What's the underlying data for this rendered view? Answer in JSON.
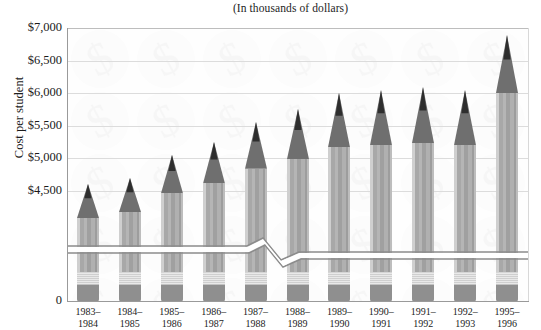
{
  "chart_data": {
    "type": "bar",
    "title": "(In thousands of dollars)",
    "xlabel": "",
    "ylabel": "Cost per student",
    "categories": [
      "1983–1984",
      "1984–1985",
      "1985–1986",
      "1986–1987",
      "1987–1988",
      "1988–1989",
      "1989–1990",
      "1990–1991",
      "1991–1992",
      "1992–1993",
      "1995–1996"
    ],
    "category_lines": [
      [
        "1983–",
        "1984"
      ],
      [
        "1984–",
        "1985"
      ],
      [
        "1985–",
        "1986"
      ],
      [
        "1986–",
        "1987"
      ],
      [
        "1987–",
        "1988"
      ],
      [
        "1988–",
        "1989"
      ],
      [
        "1989–",
        "1990"
      ],
      [
        "1990–",
        "1991"
      ],
      [
        "1991–",
        "1992"
      ],
      [
        "1992–",
        "1993"
      ],
      [
        "1995–",
        "1996"
      ]
    ],
    "values": [
      4600,
      4700,
      5050,
      5250,
      5550,
      5750,
      6000,
      6050,
      6100,
      6050,
      6900
    ],
    "value_labels": [
      "$4,600",
      "$4,700",
      "$5,050",
      "$5,250",
      "$5,550",
      "$5,750",
      "$6,000",
      "$6,050",
      "$6,100",
      "$6,050",
      "$6,900"
    ],
    "ytick_labels": [
      "$7,000",
      "$6,500",
      "$6,000",
      "$5,500",
      "$5,000",
      "$4,500",
      "0"
    ],
    "ytick_values": [
      7000,
      6500,
      6000,
      5500,
      5000,
      4500,
      0
    ],
    "ylim": [
      4250,
      7000
    ],
    "grid": true,
    "legend": false,
    "axis_break": true,
    "axis_break_note": "y-axis broken between 0 and $4,250",
    "bar_style": "pencil",
    "colors": {
      "tip": "#6f6f6f",
      "body": "#b0b0b0",
      "ferrule": "#d8d8d8",
      "eraser": "#8f8f8f",
      "gridline": "#dcdcdc",
      "axis": "#9a9a9a",
      "text": "#1c1c1c",
      "background": "#ffffff"
    }
  }
}
